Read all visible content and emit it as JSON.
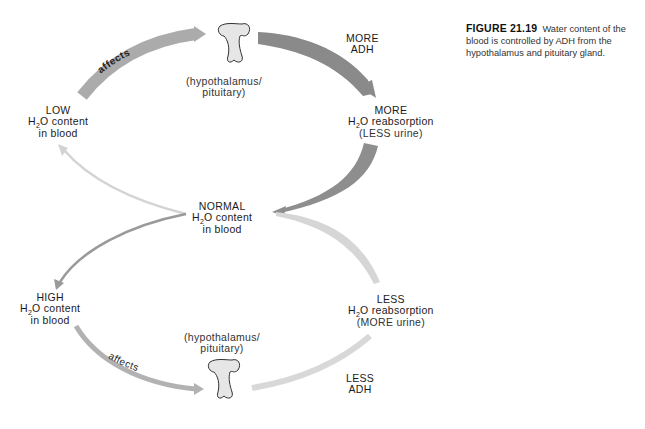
{
  "caption": {
    "figure_number": "FIGURE 21.19",
    "text": "Water content of the blood is controlled by ADH from the hypothalamus and pituitary gland."
  },
  "nodes": {
    "low": {
      "line1": "LOW",
      "h": "H",
      "sub": "2",
      "rest": "O content",
      "line3": "in blood"
    },
    "normal": {
      "line1": "NORMAL",
      "h": "H",
      "sub": "2",
      "rest": "O content",
      "line3": "in blood"
    },
    "high": {
      "line1": "HIGH",
      "h": "H",
      "sub": "2",
      "rest": "O content",
      "line3": "in blood"
    },
    "more_reabsorption": {
      "line1": "MORE",
      "h": "H",
      "sub": "2",
      "rest": "O reabsorption",
      "line3": "(LESS urine)"
    },
    "less_reabsorption": {
      "line1": "LESS",
      "h": "H",
      "sub": "2",
      "rest": "O reabsorption",
      "line3": "(MORE urine)"
    },
    "gland_top": {
      "line1": "(hypothalamus/",
      "line2": "pituitary)"
    },
    "gland_bottom": {
      "line1": "(hypothalamus/",
      "line2": "pituitary)"
    },
    "more_adh": {
      "line1": "MORE",
      "line2": "ADH"
    },
    "less_adh": {
      "line1": "LESS",
      "line2": "ADH"
    }
  },
  "arrows": {
    "top_affects": "affects",
    "bottom_affects": "affects"
  },
  "colors": {
    "arrow_dark": "#8a8a8a",
    "arrow_mid": "#a8a8a8",
    "arrow_light": "#d2d2d2",
    "gland_fill": "#e6e6e6",
    "gland_stroke": "#333333"
  }
}
